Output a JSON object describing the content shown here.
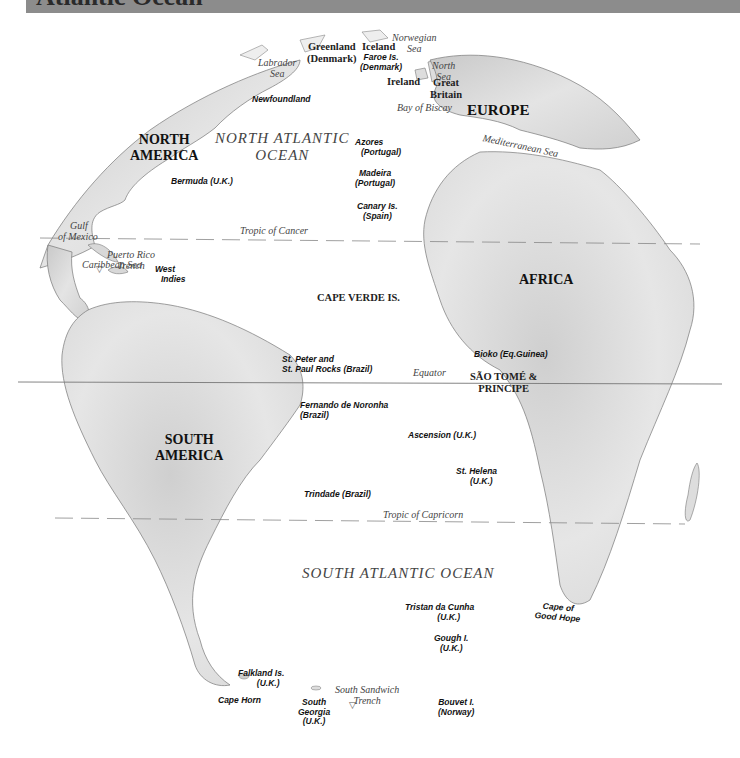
{
  "header": {
    "title": "Atlantic Ocean",
    "bar_color": "#8c8c8c"
  },
  "continents": {
    "north_america": [
      "NORTH",
      "AMERICA"
    ],
    "south_america": [
      "SOUTH",
      "AMERICA"
    ],
    "europe": "EUROPE",
    "africa": "AFRICA"
  },
  "oceans": {
    "north_atlantic": [
      "NORTH ATLANTIC",
      "OCEAN"
    ],
    "south_atlantic": "SOUTH ATLANTIC OCEAN"
  },
  "seas": {
    "labrador": [
      "Labrador",
      "Sea"
    ],
    "norwegian": [
      "Norwegian",
      "Sea"
    ],
    "north_sea": [
      "North",
      "Sea"
    ],
    "bay_of_biscay": "Bay of Biscay",
    "mediterranean": "Mediterranean Sea",
    "gulf_of_mexico": [
      "Gulf",
      "of Mexico"
    ],
    "caribbean": "Caribbean Sea",
    "puerto_rico_trench": [
      "Puerto Rico",
      "Trench"
    ],
    "south_sandwich_trench": [
      "South Sandwich",
      "Trench"
    ]
  },
  "lines": {
    "tropic_of_cancer": "Tropic of Cancer",
    "equator": "Equator",
    "tropic_of_capricorn": "Tropic of Capricorn"
  },
  "countries": {
    "greenland": [
      "Greenland",
      "(Denmark)"
    ],
    "iceland": "Iceland",
    "ireland": "Ireland",
    "great_britain": [
      "Great",
      "Britain"
    ],
    "cape_verde": "CAPE VERDE IS.",
    "sao_tome": [
      "SÃO TOMÉ &",
      "PRINCIPE"
    ]
  },
  "islands": {
    "faroe": [
      "Faroe Is.",
      "(Denmark)"
    ],
    "newfoundland": "Newfoundland",
    "azores": [
      "Azores",
      "(Portugal)"
    ],
    "madeira": [
      "Madeira",
      "(Portugal)"
    ],
    "canary": [
      "Canary Is.",
      "(Spain)"
    ],
    "bermuda": "Bermuda (U.K.)",
    "west_indies": [
      "West",
      "Indies"
    ],
    "st_peter_paul": [
      "St. Peter and",
      "St. Paul Rocks (Brazil)"
    ],
    "bioko": "Bioko (Eq.Guinea)",
    "fernando": [
      "Fernando de Noronha",
      "(Brazil)"
    ],
    "ascension": "Ascension (U.K.)",
    "st_helena": [
      "St. Helena",
      "(U.K.)"
    ],
    "trindade": "Trindade (Brazil)",
    "tristan": [
      "Tristan da Cunha",
      "(U.K.)"
    ],
    "gough": [
      "Gough I.",
      "(U.K.)"
    ],
    "cape_good_hope": [
      "Cape of",
      "Good Hope"
    ],
    "falkland": [
      "Falkland Is.",
      "(U.K.)"
    ],
    "cape_horn": "Cape Horn",
    "south_georgia": [
      "South",
      "Georgia",
      "(U.K.)"
    ],
    "bouvet": [
      "Bouvet I.",
      "(Norway)"
    ]
  }
}
